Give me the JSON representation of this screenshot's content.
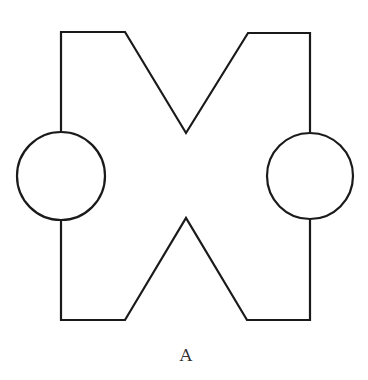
{
  "figure": {
    "label": "A",
    "stroke_color": "#1a1a1a",
    "background": "#ffffff",
    "components": [
      "left-circle",
      "right-circle",
      "upper-v-wire",
      "lower-inverted-v-wire"
    ]
  }
}
